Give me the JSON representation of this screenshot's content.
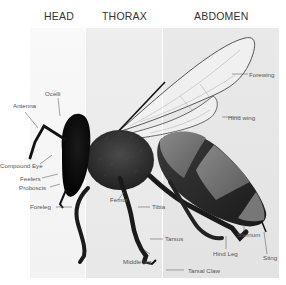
{
  "sections": [
    {
      "label": "HEAD"
    },
    {
      "label": "THORAX"
    },
    {
      "label": "ABDOMEN"
    }
  ],
  "labels": {
    "ocelli": "Ocelli",
    "antenna": "Antenna",
    "compound_eye": "Compound Eye",
    "feelers": "Feelers",
    "proboscis": "Proboscis",
    "foreleg": "Foreleg",
    "femur": "Femur",
    "tibia": "Tibia",
    "tarsus": "Tarsus",
    "middle_leg": "Middle leg",
    "tarsal_claw": "Tarsal Claw",
    "forewing": "Forewing",
    "hind_wing": "Hind wing",
    "sternum": "Sternum",
    "hind_leg": "Hind Leg",
    "sting": "Sting"
  },
  "colors": {
    "head_panel": "#f7f7f7",
    "thorax_panel": "#ececec",
    "abdomen_panel": "#e6e6e6",
    "label_text": "#555555",
    "leader_line": "#666666"
  }
}
